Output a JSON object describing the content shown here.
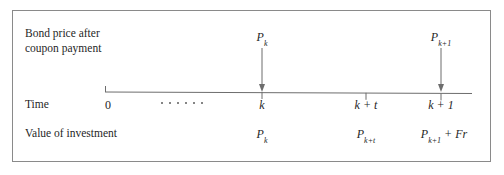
{
  "figure": {
    "title_block": {
      "line1": "Bond price after",
      "line2": "coupon payment"
    },
    "row_labels": {
      "time": "Time",
      "value": "Value of investment"
    },
    "colors": {
      "frame": "#8a8a8a",
      "axis": "#6d6d6d",
      "text": "#1f1f1f",
      "background": "#ffffff"
    },
    "bond_price_markers": [
      {
        "label": "P",
        "subscript": "k",
        "at_tick": "k"
      },
      {
        "label": "P",
        "subscript": "k+1",
        "at_tick": "k+1"
      }
    ],
    "timeline": {
      "ticks": [
        {
          "label": "0",
          "subscript": "",
          "x": 108
        },
        {
          "label": "k",
          "subscript": "",
          "x": 262
        },
        {
          "label": "k + t",
          "subscript": "",
          "x": 366
        },
        {
          "label": "k + 1",
          "subscript": "",
          "x": 441
        }
      ],
      "ellipsis_dots": 6
    },
    "value_row": [
      {
        "base": "P",
        "subscript": "k",
        "extra": ""
      },
      {
        "base": "P",
        "subscript": "k+t",
        "extra": ""
      },
      {
        "base": "P",
        "subscript": "k+1",
        "extra": " + Fr"
      }
    ]
  }
}
